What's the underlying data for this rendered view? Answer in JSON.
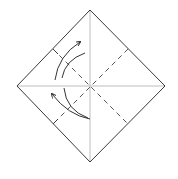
{
  "diagram": {
    "colors": {
      "outline": "#3a3a3a",
      "crease": "#bdbdbd",
      "dashed": "#555555",
      "arrow": "#333333",
      "background": "#ffffff"
    },
    "paper": {
      "shape": "square rotated 45°",
      "corners": {
        "top": [
          90,
          10
        ],
        "right": [
          165,
          86
        ],
        "bottom": [
          90,
          162
        ],
        "left": [
          17,
          86
        ]
      }
    },
    "creases": [
      {
        "type": "valley-crease-solid",
        "from": [
          17,
          86
        ],
        "to": [
          165,
          86
        ]
      },
      {
        "type": "valley-crease-solid",
        "from": [
          90,
          10
        ],
        "to": [
          90,
          162
        ]
      }
    ],
    "fold_lines": [
      {
        "type": "dashed",
        "from": [
          53,
          49
        ],
        "to": [
          128,
          124
        ]
      },
      {
        "type": "dashed",
        "from": [
          128,
          49
        ],
        "to": [
          53,
          124
        ]
      }
    ],
    "arrows": [
      {
        "name": "fold-up-arrow",
        "direction": "up-right"
      },
      {
        "name": "fold-down-arrow",
        "direction": "up-left"
      }
    ]
  }
}
